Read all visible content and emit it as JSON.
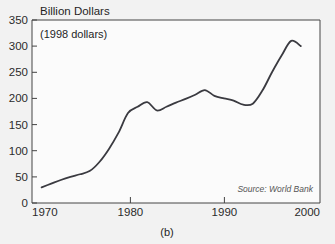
{
  "figure": {
    "caption": "(b)",
    "title": "Billion Dollars",
    "subtitle": "(1998 dollars)",
    "source": "Source: World Bank"
  },
  "chart_data": {
    "type": "line",
    "title": "Billion Dollars",
    "subtitle": "(1998 dollars)",
    "xlabel": "",
    "ylabel": "Billion Dollars",
    "xlim": [
      1970,
      2000
    ],
    "ylim": [
      0,
      350
    ],
    "xticks": [
      1970,
      1980,
      1990,
      2000
    ],
    "yticks": [
      0,
      50,
      100,
      150,
      200,
      250,
      300,
      350
    ],
    "grid": false,
    "legend": null,
    "annotations": [
      "Source: World Bank",
      "(1998 dollars)"
    ],
    "series": [
      {
        "name": "Billion Dollars (1998 dollars)",
        "color": "#3a3a40",
        "x": [
          1971,
          1972,
          1973,
          1974,
          1975,
          1976,
          1977,
          1978,
          1979,
          1980,
          1981,
          1982,
          1983,
          1984,
          1985,
          1986,
          1987,
          1988,
          1989,
          1990,
          1991,
          1992,
          1993,
          1994,
          1995,
          1996,
          1997,
          1998
        ],
        "values": [
          30,
          37,
          44,
          50,
          55,
          61,
          78,
          103,
          134,
          172,
          184,
          193,
          177,
          184,
          192,
          199,
          207,
          216,
          205,
          200,
          196,
          188,
          190,
          215,
          250,
          282,
          310,
          300
        ]
      }
    ]
  }
}
